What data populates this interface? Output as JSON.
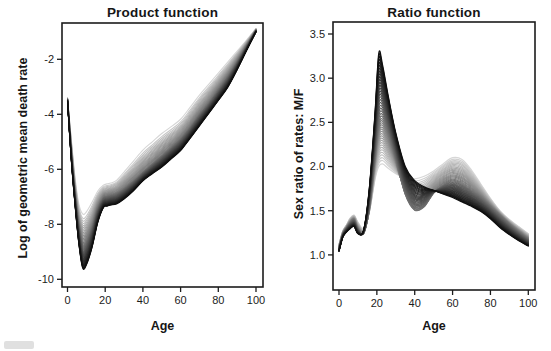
{
  "figure": {
    "background": "#ffffff",
    "axis_color": "#1c1c1c",
    "n_panels": 2
  },
  "chart_data": [
    {
      "type": "line",
      "title": "Product function",
      "xlabel": "Age",
      "ylabel": "Log of geometric mean death rate",
      "xlim": [
        0,
        100
      ],
      "ylim": [
        -10.35,
        -0.65
      ],
      "x_tick_values": [
        0,
        20,
        40,
        60,
        80,
        100
      ],
      "x_tick_labels": [
        "0",
        "20",
        "40",
        "60",
        "80",
        "100"
      ],
      "y_tick_values": [
        -2,
        -4,
        -6,
        -8,
        -10
      ],
      "y_tick_labels": [
        "-2",
        "-4",
        "-6",
        "-8",
        "-10"
      ],
      "grid": false,
      "legend": null,
      "n_curves": 46,
      "shade_light": "#d6d6d6",
      "shade_dark": "#0f0f0f",
      "distribution_bias": 0.7,
      "x": [
        0,
        2,
        4,
        6,
        8,
        10,
        13,
        16,
        19,
        21,
        23,
        26,
        30,
        35,
        40,
        45,
        50,
        55,
        60,
        65,
        70,
        75,
        80,
        85,
        90,
        95,
        100
      ],
      "anchors": {
        "lightest": [
          -3.4,
          -4.9,
          -6.3,
          -7.25,
          -7.62,
          -7.55,
          -7.2,
          -6.8,
          -6.58,
          -6.53,
          -6.5,
          -6.4,
          -6.1,
          -5.7,
          -5.3,
          -5.0,
          -4.7,
          -4.45,
          -4.18,
          -3.75,
          -3.3,
          -2.9,
          -2.5,
          -2.1,
          -1.7,
          -1.3,
          -0.88
        ],
        "middle": [
          -3.45,
          -5.3,
          -6.85,
          -8.0,
          -8.7,
          -8.62,
          -8.1,
          -7.4,
          -7.02,
          -6.97,
          -6.93,
          -6.88,
          -6.7,
          -6.42,
          -6.1,
          -5.8,
          -5.5,
          -5.2,
          -4.88,
          -4.47,
          -4.0,
          -3.58,
          -3.1,
          -2.62,
          -2.08,
          -1.5,
          -0.94
        ],
        "darkest": [
          -3.52,
          -5.65,
          -7.3,
          -8.7,
          -9.58,
          -9.48,
          -8.85,
          -7.95,
          -7.4,
          -7.34,
          -7.3,
          -7.26,
          -7.08,
          -6.78,
          -6.42,
          -6.16,
          -5.92,
          -5.62,
          -5.32,
          -4.88,
          -4.42,
          -3.96,
          -3.5,
          -3.02,
          -2.38,
          -1.68,
          -1.0
        ]
      }
    },
    {
      "type": "line",
      "title": "Ratio function",
      "xlabel": "Age",
      "ylabel": "Sex ratio of rates: M/F",
      "xlim": [
        0,
        100
      ],
      "ylim": [
        0.6,
        3.64
      ],
      "x_tick_values": [
        0,
        20,
        40,
        60,
        80,
        100
      ],
      "x_tick_labels": [
        "0",
        "20",
        "40",
        "60",
        "80",
        "100"
      ],
      "y_tick_values": [
        3.5,
        3.0,
        2.5,
        2.0,
        1.5,
        1.0
      ],
      "y_tick_labels": [
        "3.5",
        "3.0",
        "2.5",
        "2.0",
        "1.5",
        "1.0"
      ],
      "grid": false,
      "legend": null,
      "n_curves": 44,
      "shade_light": "#d7d7d7",
      "shade_dark": "#0f0f0f",
      "distribution_bias": 0.88,
      "x": [
        0,
        2,
        4,
        6,
        8,
        10,
        13,
        16,
        19,
        21,
        23,
        26,
        30,
        35,
        40,
        45,
        50,
        55,
        60,
        65,
        70,
        75,
        80,
        85,
        90,
        95,
        100
      ],
      "anchors": {
        "lightest": [
          1.12,
          1.27,
          1.34,
          1.42,
          1.45,
          1.37,
          1.3,
          1.48,
          1.85,
          2.0,
          2.03,
          1.98,
          1.92,
          1.87,
          1.86,
          1.89,
          1.95,
          2.03,
          2.1,
          2.08,
          1.96,
          1.8,
          1.64,
          1.5,
          1.4,
          1.32,
          1.24
        ],
        "middle": [
          1.08,
          1.24,
          1.31,
          1.37,
          1.4,
          1.3,
          1.24,
          1.52,
          2.1,
          2.48,
          2.55,
          2.38,
          2.08,
          1.68,
          1.5,
          1.54,
          1.7,
          1.79,
          1.84,
          1.8,
          1.73,
          1.65,
          1.55,
          1.45,
          1.35,
          1.26,
          1.18
        ],
        "darkest": [
          1.04,
          1.2,
          1.26,
          1.3,
          1.32,
          1.24,
          1.28,
          1.75,
          2.6,
          3.28,
          3.15,
          2.8,
          2.38,
          2.0,
          1.84,
          1.77,
          1.73,
          1.69,
          1.65,
          1.6,
          1.55,
          1.49,
          1.41,
          1.31,
          1.23,
          1.16,
          1.1
        ]
      }
    }
  ]
}
